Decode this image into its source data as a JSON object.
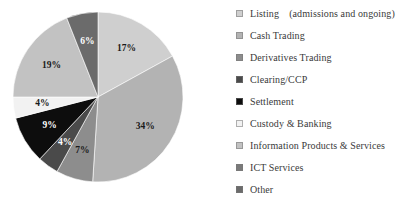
{
  "chart_data": {
    "type": "pie",
    "title": "",
    "subtitle": "",
    "xlabel": "",
    "ylabel": "",
    "grid": false,
    "legend_position": "right",
    "value_suffix": "%",
    "start_angle_deg": 0,
    "direction": "clockwise",
    "categories": [
      "Listing (admissions and ongoing)",
      "Cash Trading",
      "Derivatives Trading",
      "Clearing/CCP",
      "Settlement",
      "Custody & Banking",
      "Information Products & Services",
      "ICT Services",
      "Other"
    ],
    "values": [
      17,
      34,
      7,
      4,
      9,
      4,
      19,
      0,
      6
    ],
    "data_labels": [
      "17%",
      "34%",
      "7%",
      "4%",
      "9%",
      "4%",
      "19%",
      "",
      "6%"
    ],
    "colors": [
      "#cfcfcf",
      "#b3b3b3",
      "#8d8d8d",
      "#4a4a4a",
      "#0d0d0d",
      "#f2f2f2",
      "#c2c2c2",
      "#7a7a7a",
      "#6b6b6b"
    ],
    "total": 100
  },
  "legend": {
    "items": [
      {
        "label": "Listing (admissions and ongoing)",
        "color": "#cfcfcf"
      },
      {
        "label": "Cash Trading",
        "color": "#b3b3b3"
      },
      {
        "label": "Derivatives Trading",
        "color": "#8d8d8d"
      },
      {
        "label": "Clearing/CCP",
        "color": "#4a4a4a"
      },
      {
        "label": "Settlement",
        "color": "#0d0d0d"
      },
      {
        "label": "Custody & Banking",
        "color": "#f2f2f2"
      },
      {
        "label": "Information Products & Services",
        "color": "#c2c2c2"
      },
      {
        "label": "ICT Services",
        "color": "#7a7a7a"
      },
      {
        "label": "Other",
        "color": "#6b6b6b"
      }
    ]
  }
}
